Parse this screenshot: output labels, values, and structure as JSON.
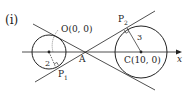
{
  "figure": {
    "part_label": "(i)",
    "points": {
      "O": {
        "label": "O(0, 0)"
      },
      "C": {
        "label": "C(10, 0)"
      },
      "A": {
        "label": "A"
      },
      "P1": {
        "label": "P",
        "sub": "1"
      },
      "P2": {
        "label": "P",
        "sub": "2"
      }
    },
    "radii": {
      "small": "2",
      "large": "3"
    },
    "axis": {
      "label": "x"
    },
    "colors": {
      "stroke": "#222222",
      "background": "#ffffff"
    }
  }
}
